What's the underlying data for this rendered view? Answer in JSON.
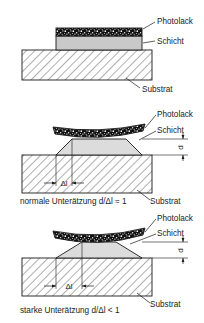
{
  "figure": {
    "colors": {
      "line": "#1a1a1a",
      "resist_fill": "#101010",
      "layer_fill": "#c9c9c9",
      "substrate_fill": "#ffffff",
      "text": "#1a1a1a"
    },
    "labels": {
      "photoresist": "Photolack",
      "layer": "Schicht",
      "substrate": "Substrat",
      "delta_l": "Δl",
      "thickness": "d"
    },
    "panels": [
      {
        "id": "panel-top",
        "name": "unetched-stack",
        "caption": "",
        "callouts": [
          "Photolack",
          "Schicht",
          "Substrat"
        ],
        "dimensions": []
      },
      {
        "id": "panel-middle",
        "name": "normal-undercut",
        "caption": "normale Unterätzung  d/Δl ≈ 1",
        "callouts": [
          "Photolack",
          "Schicht",
          "Substrat"
        ],
        "dimensions": [
          "Δl",
          "d"
        ]
      },
      {
        "id": "panel-bottom",
        "name": "strong-undercut",
        "caption": "starke Unterätzung  d/Δl < 1",
        "callouts": [
          "Photolack",
          "Schicht",
          "Substrat"
        ],
        "dimensions": [
          "Δl",
          "d"
        ]
      }
    ]
  }
}
